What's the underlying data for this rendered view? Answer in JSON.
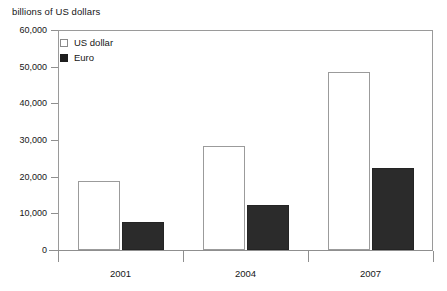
{
  "chart_data": {
    "type": "bar",
    "title": "billions of US dollars",
    "xlabel": "",
    "ylabel": "billions of US dollars",
    "categories": [
      "2001",
      "2004",
      "2007"
    ],
    "series": [
      {
        "name": "US dollar",
        "values": [
          18800,
          28400,
          48500
        ],
        "color": "#ffffff"
      },
      {
        "name": "Euro",
        "values": [
          7600,
          12300,
          22400
        ],
        "color": "#2b2b2b"
      }
    ],
    "ylim": [
      0,
      60000
    ],
    "yticks": [
      0,
      10000,
      20000,
      30000,
      40000,
      50000,
      60000
    ],
    "ytick_labels": [
      "0",
      "10,000",
      "20,000",
      "30,000",
      "40,000",
      "50,000",
      "60,000"
    ],
    "grid": false,
    "legend_position": "top-left"
  },
  "legend": {
    "items": [
      {
        "label": "US dollar",
        "swatch": "open-square-swatch"
      },
      {
        "label": "Euro",
        "swatch": "filled-square-swatch"
      }
    ]
  },
  "colors": {
    "usd_fill": "#ffffff",
    "usd_border": "#9b9b9b",
    "euro_fill": "#2b2b2b",
    "axis": "#8f8f8f",
    "text": "#161616",
    "background": "#ffffff"
  }
}
